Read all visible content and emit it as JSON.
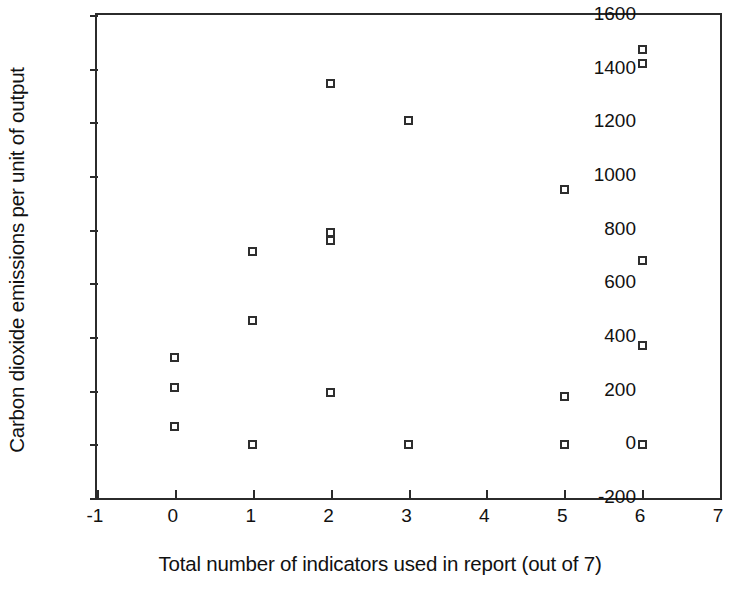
{
  "chart_data": {
    "type": "scatter",
    "title": "",
    "xlabel": "Total number of indicators used in report (out of 7)",
    "ylabel": "Carbon dioxide emissions per unit of output",
    "xlim": [
      -1,
      7
    ],
    "ylim": [
      -200,
      1600
    ],
    "xticks": [
      -1,
      0,
      1,
      2,
      3,
      4,
      5,
      6,
      7
    ],
    "xtick_labels": [
      "-1",
      "0",
      "1",
      "2",
      "3",
      "4",
      "5",
      "6",
      "7"
    ],
    "yticks": [
      -200,
      0,
      200,
      400,
      600,
      800,
      1000,
      1200,
      1400,
      1600
    ],
    "ytick_labels": [
      "-200",
      "0",
      "200",
      "400",
      "600",
      "800",
      "1000",
      "1200",
      "1400",
      "1600"
    ],
    "grid": false,
    "legend": false,
    "marker_style": "open-square",
    "marker_color": "#2e2e2e",
    "points": [
      {
        "x": 0,
        "y": 325
      },
      {
        "x": 0,
        "y": 210
      },
      {
        "x": 0,
        "y": 65
      },
      {
        "x": 1,
        "y": 720
      },
      {
        "x": 1,
        "y": 460
      },
      {
        "x": 1,
        "y": 0
      },
      {
        "x": 2,
        "y": 1345
      },
      {
        "x": 2,
        "y": 790
      },
      {
        "x": 2,
        "y": 760
      },
      {
        "x": 2,
        "y": 195
      },
      {
        "x": 3,
        "y": 1205
      },
      {
        "x": 3,
        "y": 0
      },
      {
        "x": 5,
        "y": 950
      },
      {
        "x": 5,
        "y": 180
      },
      {
        "x": 5,
        "y": 0
      },
      {
        "x": 6,
        "y": 1470
      },
      {
        "x": 6,
        "y": 1420
      },
      {
        "x": 6,
        "y": 685
      },
      {
        "x": 6,
        "y": 370
      },
      {
        "x": 6,
        "y": 0
      }
    ]
  }
}
